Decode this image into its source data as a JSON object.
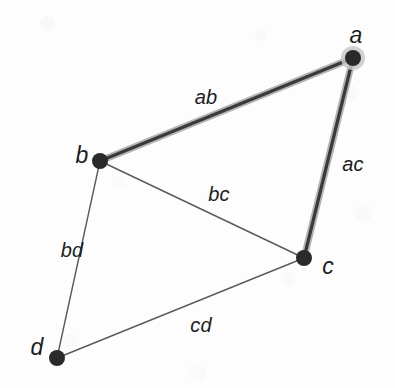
{
  "figure": {
    "type": "graph-diagram",
    "width": 395,
    "height": 388,
    "background_color": "#fdfdfd"
  },
  "style": {
    "node_fill": "#2a2a2a",
    "node_radius": 8,
    "node_halo_color": "#c9c9c9",
    "thin_edge_color": "#5a5a5a",
    "thin_edge_width": 1.4,
    "thick_edge_core_color": "#3a3a3a",
    "thick_edge_casing_color": "#b4b4b4",
    "thick_edge_width": 3.2,
    "thick_edge_casing_width": 7
  },
  "nodes": [
    {
      "id": "a",
      "label": "a",
      "x": 353,
      "y": 58,
      "highlighted": true,
      "label_x": 356,
      "label_y": 35
    },
    {
      "id": "b",
      "label": "b",
      "x": 100,
      "y": 161,
      "highlighted": false,
      "label_x": 82,
      "label_y": 155
    },
    {
      "id": "c",
      "label": "c",
      "x": 304,
      "y": 258,
      "highlighted": false,
      "label_x": 328,
      "label_y": 266
    },
    {
      "id": "d",
      "label": "d",
      "x": 57,
      "y": 358,
      "highlighted": false,
      "label_x": 37,
      "label_y": 347
    }
  ],
  "edges": [
    {
      "id": "ab",
      "label": "ab",
      "from": "a",
      "to": "b",
      "x1": 353,
      "y1": 58,
      "x2": 100,
      "y2": 161,
      "emphasis": "thick",
      "label_x": 206,
      "label_y": 97
    },
    {
      "id": "ac",
      "label": "ac",
      "from": "a",
      "to": "c",
      "x1": 353,
      "y1": 58,
      "x2": 304,
      "y2": 258,
      "emphasis": "thick",
      "label_x": 353,
      "label_y": 164
    },
    {
      "id": "bc",
      "label": "bc",
      "from": "b",
      "to": "c",
      "x1": 100,
      "y1": 161,
      "x2": 304,
      "y2": 258,
      "emphasis": "thin",
      "label_x": 219,
      "label_y": 194
    },
    {
      "id": "bd",
      "label": "bd",
      "from": "b",
      "to": "d",
      "x1": 100,
      "y1": 161,
      "x2": 57,
      "y2": 358,
      "emphasis": "thin",
      "label_x": 72,
      "label_y": 250
    },
    {
      "id": "cd",
      "label": "cd",
      "from": "c",
      "to": "d",
      "x1": 304,
      "y1": 258,
      "x2": 57,
      "y2": 358,
      "emphasis": "thin",
      "label_x": 201,
      "label_y": 325
    }
  ]
}
